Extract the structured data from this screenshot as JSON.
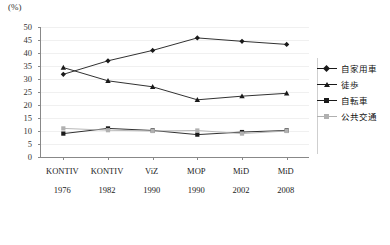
{
  "chart_data": {
    "type": "line",
    "title": "",
    "subtitle": "",
    "xlabel": "",
    "ylabel": "(%)",
    "unit_label": "(%)",
    "ylim": [
      0,
      50
    ],
    "yticks": [
      0,
      5,
      10,
      15,
      20,
      25,
      30,
      35,
      40,
      45,
      50
    ],
    "grid": true,
    "legend_position": "right",
    "categories": [
      "KONTIV 1976",
      "KONTIV 1982",
      "ViZ 1990",
      "MOP 1990",
      "MiD 2002",
      "MiD 2008"
    ],
    "category_names": [
      "KONTIV",
      "KONTIV",
      "ViZ",
      "MOP",
      "MiD",
      "MiD"
    ],
    "category_years": [
      "1976",
      "1982",
      "1990",
      "1990",
      "2002",
      "2008"
    ],
    "series": [
      {
        "name": "自家用車",
        "color": "#1a1a1a",
        "marker": "diamond",
        "values": [
          31.8,
          37.0,
          41.0,
          45.8,
          44.5,
          43.3
        ]
      },
      {
        "name": "徒歩",
        "color": "#1a1a1a",
        "marker": "triangle",
        "values": [
          34.4,
          29.3,
          27.0,
          22.0,
          23.4,
          24.5
        ]
      },
      {
        "name": "自転車",
        "color": "#1a1a1a",
        "marker": "square",
        "values": [
          9.0,
          11.0,
          10.2,
          8.6,
          9.6,
          10.2
        ]
      },
      {
        "name": "公共交通",
        "color": "#b0b0b0",
        "marker": "square",
        "values": [
          11.0,
          10.3,
          10.0,
          10.2,
          9.0,
          10.0
        ]
      }
    ]
  },
  "legend": {
    "items": [
      {
        "label": "自家用車"
      },
      {
        "label": "徒歩"
      },
      {
        "label": "自転車"
      },
      {
        "label": "公共交通"
      }
    ]
  },
  "colors": {
    "axis": "#888888",
    "grid": "#f0f0f0",
    "dark_series": "#1a1a1a",
    "light_series": "#b0b0b0",
    "text": "#1a1a1a"
  }
}
